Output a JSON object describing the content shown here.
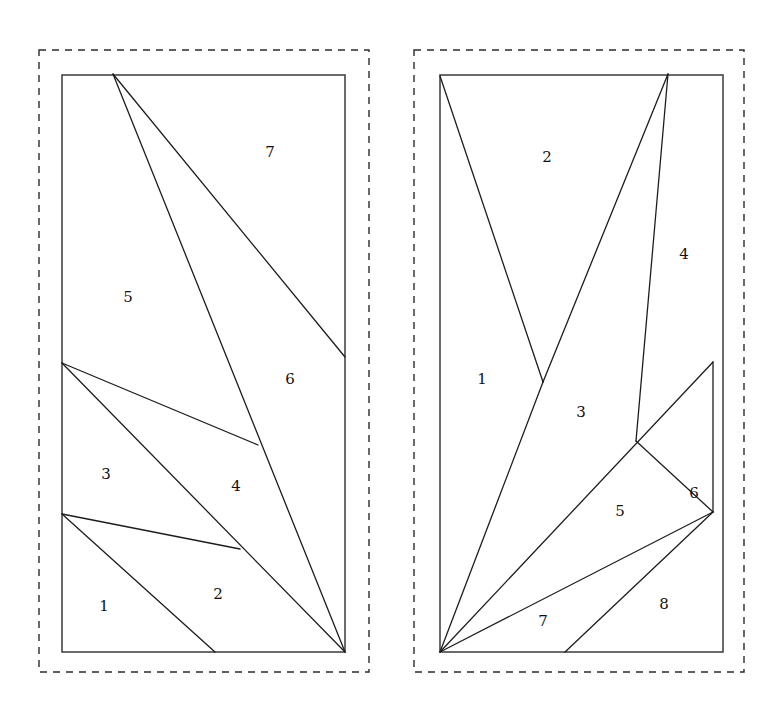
{
  "figure": {
    "background_color": "#ffffff",
    "stroke_color": "#1d1d1d",
    "dashed_color": "#2b2b2b",
    "width": 763,
    "height": 715
  },
  "panels": [
    {
      "id": "left-panel",
      "name": "left-partition-diagram",
      "dashed_border": {
        "x": 39,
        "y": 50,
        "width": 330,
        "height": 622
      },
      "rectangle": {
        "x": 62,
        "y": 75,
        "width": 283,
        "height": 577
      },
      "region_count": 7,
      "labels": [
        {
          "text": "1",
          "x": 104,
          "y": 607
        },
        {
          "text": "2",
          "x": 218,
          "y": 595
        },
        {
          "text": "3",
          "x": 106,
          "y": 475
        },
        {
          "text": "4",
          "x": 236,
          "y": 487
        },
        {
          "text": "5",
          "x": 128,
          "y": 298
        },
        {
          "text": "6",
          "x": 290,
          "y": 380
        },
        {
          "text": "7",
          "x": 270,
          "y": 153
        }
      ],
      "cuts": [
        {
          "name": "apex-to-right-edge",
          "from": [
            113,
            74
          ],
          "to": [
            345,
            357
          ]
        },
        {
          "name": "apex-to-bottom-right",
          "from": [
            113,
            74
          ],
          "to": [
            345,
            652
          ]
        },
        {
          "name": "left-edge-upper-to-mid",
          "from": [
            62,
            363
          ],
          "to": [
            258,
            445
          ]
        },
        {
          "name": "left-edge-upper-to-bottom-right",
          "from": [
            62,
            363
          ],
          "to": [
            345,
            652
          ]
        },
        {
          "name": "left-edge-lower-to-mid",
          "from": [
            62,
            514
          ],
          "to": [
            240,
            549
          ]
        },
        {
          "name": "left-edge-lower-to-bottom",
          "from": [
            62,
            514
          ],
          "to": [
            215,
            652
          ]
        }
      ]
    },
    {
      "id": "right-panel",
      "name": "right-partition-diagram",
      "dashed_border": {
        "x": 414,
        "y": 50,
        "width": 330,
        "height": 622
      },
      "rectangle": {
        "x": 440,
        "y": 75,
        "width": 283,
        "height": 577
      },
      "region_count": 8,
      "labels": [
        {
          "text": "1",
          "x": 482,
          "y": 380
        },
        {
          "text": "2",
          "x": 547,
          "y": 158
        },
        {
          "text": "3",
          "x": 581,
          "y": 413
        },
        {
          "text": "4",
          "x": 684,
          "y": 255
        },
        {
          "text": "5",
          "x": 620,
          "y": 512
        },
        {
          "text": "6",
          "x": 694,
          "y": 494
        },
        {
          "text": "7",
          "x": 543,
          "y": 622
        },
        {
          "text": "8",
          "x": 664,
          "y": 605
        }
      ],
      "cuts": [
        {
          "name": "topleft-to-v-vertex",
          "from": [
            440,
            76
          ],
          "to": [
            543,
            382
          ]
        },
        {
          "name": "v-vertex-to-top-apex",
          "from": [
            543,
            382
          ],
          "to": [
            668,
            74
          ]
        },
        {
          "name": "bottomleft-to-v-vertex-extended",
          "from": [
            440,
            652
          ],
          "to": [
            543,
            382
          ]
        },
        {
          "name": "top-apex-to-inner-vertex",
          "from": [
            668,
            74
          ],
          "to": [
            636,
            441
          ]
        },
        {
          "name": "bottomleft-to-right-edge-upper",
          "from": [
            440,
            652
          ],
          "to": [
            713,
            362
          ]
        },
        {
          "name": "right-edge-upper-to-right-edge-lower",
          "from": [
            713,
            362
          ],
          "to": [
            713,
            512
          ]
        },
        {
          "name": "inner-vertex-to-right-edge-lower",
          "from": [
            636,
            441
          ],
          "to": [
            713,
            512
          ]
        },
        {
          "name": "bottomleft-to-right-edge-lower",
          "from": [
            440,
            652
          ],
          "to": [
            713,
            512
          ]
        },
        {
          "name": "right-edge-lower-to-bottom",
          "from": [
            713,
            512
          ],
          "to": [
            565,
            652
          ]
        }
      ]
    }
  ]
}
